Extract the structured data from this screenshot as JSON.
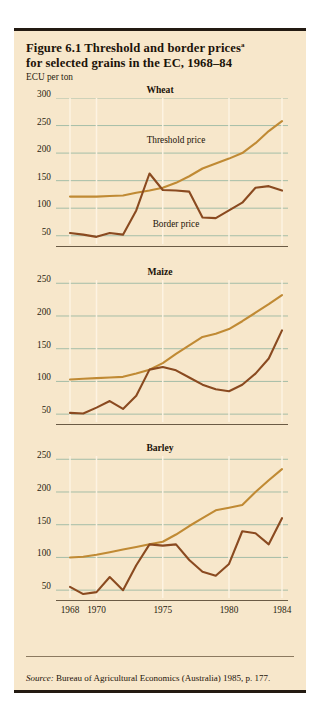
{
  "figure": {
    "title_line1": "Figure 6.1  Threshold and border prices",
    "title_superscript": "a",
    "title_line2": "for selected grains in the EC, 1968–84",
    "unit_label": "ECU per ton",
    "source_prefix": "Source:",
    "source_text": " Bureau of Agricultural Economics (Australia) 1985, p. 177.",
    "background_color": "#f7e7cb",
    "threshold_color": "#c08a34",
    "border_color": "#8a4a20",
    "gridline_color": "#9cb9a4",
    "vgrid_color": "#fdf3e2"
  },
  "chart_data": [
    {
      "type": "line",
      "title": "Wheat",
      "xlabel": "",
      "ylabel": "ECU per ton",
      "x": [
        1968,
        1969,
        1970,
        1971,
        1972,
        1973,
        1974,
        1975,
        1976,
        1977,
        1978,
        1979,
        1980,
        1981,
        1982,
        1983,
        1984
      ],
      "xticks": [
        1968,
        1970,
        1975,
        1980,
        1984
      ],
      "xticklabels": [
        "1968",
        "1970",
        "1975",
        "1980",
        "1984"
      ],
      "yticks": [
        50,
        100,
        150,
        200,
        250,
        300
      ],
      "yticklabels": [
        "50",
        "100",
        "150",
        "200",
        "250",
        "300"
      ],
      "ylim": [
        35,
        300
      ],
      "grid": true,
      "legend_position": "inline-annotations",
      "series": [
        {
          "name": "Threshold price",
          "color": "#c08a34",
          "label_x": 1976,
          "label_y": 222,
          "values": [
            121,
            121,
            121,
            122,
            123,
            128,
            132,
            137,
            146,
            158,
            172,
            181,
            190,
            200,
            218,
            240,
            258
          ]
        },
        {
          "name": "Border price",
          "color": "#8a4a20",
          "label_x": 1976,
          "label_y": 70,
          "values": [
            55,
            52,
            48,
            55,
            52,
            96,
            163,
            133,
            132,
            130,
            83,
            82,
            96,
            110,
            137,
            140,
            132,
            165
          ]
        }
      ]
    },
    {
      "type": "line",
      "title": "Maize",
      "xlabel": "",
      "ylabel": "",
      "x": [
        1968,
        1969,
        1970,
        1971,
        1972,
        1973,
        1974,
        1975,
        1976,
        1977,
        1978,
        1979,
        1980,
        1981,
        1982,
        1983,
        1984
      ],
      "xticks": [
        1968,
        1970,
        1975,
        1980,
        1984
      ],
      "xticklabels": [
        "1968",
        "1970",
        "1975",
        "1980",
        "1984"
      ],
      "yticks": [
        50,
        100,
        150,
        200,
        250
      ],
      "yticklabels": [
        "50",
        "100",
        "150",
        "200",
        "250"
      ],
      "ylim": [
        38,
        255
      ],
      "grid": true,
      "legend_position": "none",
      "series": [
        {
          "name": "Threshold price",
          "color": "#c08a34",
          "values": [
            103,
            104,
            105,
            106,
            107,
            112,
            118,
            128,
            142,
            155,
            168,
            173,
            180,
            192,
            205,
            218,
            232
          ]
        },
        {
          "name": "Border price",
          "color": "#8a4a20",
          "values": [
            52,
            51,
            60,
            70,
            58,
            78,
            118,
            122,
            117,
            106,
            95,
            88,
            85,
            95,
            112,
            135,
            178
          ]
        }
      ]
    },
    {
      "type": "line",
      "title": "Barley",
      "xlabel": "",
      "ylabel": "",
      "x": [
        1968,
        1969,
        1970,
        1971,
        1972,
        1973,
        1974,
        1975,
        1976,
        1977,
        1978,
        1979,
        1980,
        1981,
        1982,
        1983,
        1984
      ],
      "xticks": [
        1968,
        1970,
        1975,
        1980,
        1984
      ],
      "xticklabels": [
        "1968",
        "1970",
        "1975",
        "1980",
        "1984"
      ],
      "yticks": [
        50,
        100,
        150,
        200,
        250
      ],
      "yticklabels": [
        "50",
        "100",
        "150",
        "200",
        "250"
      ],
      "ylim": [
        38,
        255
      ],
      "grid": true,
      "legend_position": "none",
      "series": [
        {
          "name": "Threshold price",
          "color": "#c08a34",
          "values": [
            100,
            101,
            104,
            108,
            112,
            116,
            120,
            124,
            135,
            148,
            160,
            172,
            176,
            180,
            200,
            218,
            235
          ]
        },
        {
          "name": "Border price",
          "color": "#8a4a20",
          "values": [
            55,
            44,
            47,
            70,
            50,
            88,
            120,
            118,
            120,
            96,
            78,
            72,
            90,
            140,
            137,
            120,
            160
          ]
        }
      ]
    }
  ]
}
